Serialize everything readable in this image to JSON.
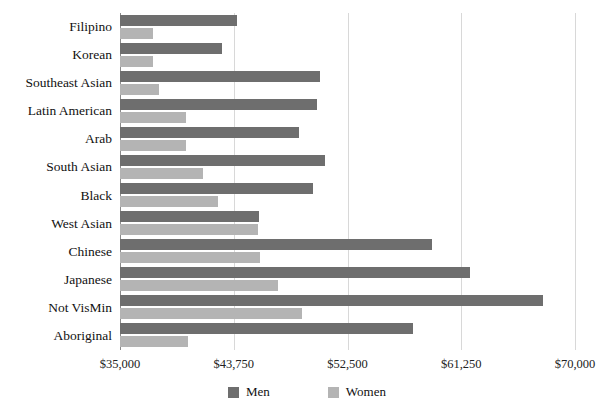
{
  "chart_data": {
    "type": "bar",
    "orientation": "horizontal",
    "title": "",
    "subtitle": "",
    "xlabel": "",
    "ylabel": "",
    "xlim": [
      35000,
      70000
    ],
    "xticks": [
      35000,
      43750,
      52500,
      61250,
      70000
    ],
    "xtick_labels": [
      "$35,000",
      "$43,750",
      "$52,500",
      "$61,250",
      "$70,000"
    ],
    "grid": true,
    "grid_axis": "x",
    "legend_position": "bottom-center",
    "categories": [
      "Filipino",
      "Korean",
      "Southeast Asian",
      "Latin American",
      "Arab",
      "South Asian",
      "Black",
      "West Asian",
      "Chinese",
      "Japanese",
      "Not VisMin",
      "Aboriginal"
    ],
    "series": [
      {
        "name": "Men",
        "color": "#6e6e6e",
        "values": [
          44000,
          42850,
          50400,
          50150,
          48800,
          50750,
          49850,
          45700,
          59000,
          61900,
          67550,
          57550
        ]
      },
      {
        "name": "Women",
        "color": "#b4b4b4",
        "values": [
          37550,
          37550,
          38000,
          40100,
          40100,
          41400,
          42550,
          45600,
          45750,
          47150,
          49000,
          40250
        ]
      }
    ]
  },
  "legend": {
    "items": [
      {
        "label": "Men",
        "color": "#6e6e6e"
      },
      {
        "label": "Women",
        "color": "#b4b4b4"
      }
    ]
  }
}
